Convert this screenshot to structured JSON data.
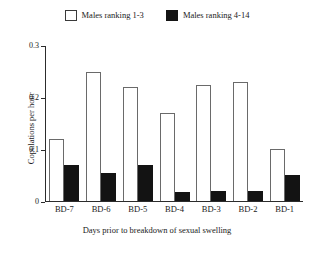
{
  "chart_data": {
    "type": "bar",
    "title": "",
    "xlabel": "Days prior to breakdown of sexual swelling",
    "ylabel": "Copulations per hour",
    "categories": [
      "BD-7",
      "BD-6",
      "BD-5",
      "BD-4",
      "BD-3",
      "BD-2",
      "BD-1"
    ],
    "series": [
      {
        "name": "Males ranking 1-3",
        "color": "#ffffff",
        "edge_color": "#6a6a6a",
        "values": [
          0.12,
          0.25,
          0.22,
          0.17,
          0.225,
          0.23,
          0.1
        ]
      },
      {
        "name": "Males ranking 4-14",
        "color": "#131313",
        "edge_color": "#131313",
        "values": [
          0.07,
          0.055,
          0.07,
          0.018,
          0.02,
          0.02,
          0.05
        ]
      }
    ],
    "ylim": [
      0,
      0.3
    ],
    "yticks": [
      0,
      0.1,
      0.2,
      0.3
    ],
    "ytick_labels": [
      "0",
      "0.1",
      "0.2",
      "0.3"
    ],
    "grid": false,
    "legend_position": "top-center"
  },
  "legend": {
    "entries": [
      {
        "label": "Males ranking 1-3",
        "swatch": "open-square-icon"
      },
      {
        "label": "Males ranking 4-14",
        "swatch": "filled-square-icon"
      }
    ]
  },
  "axes": {
    "y_title": "Copulations per hour",
    "x_title": "Days prior to breakdown of sexual swelling"
  }
}
